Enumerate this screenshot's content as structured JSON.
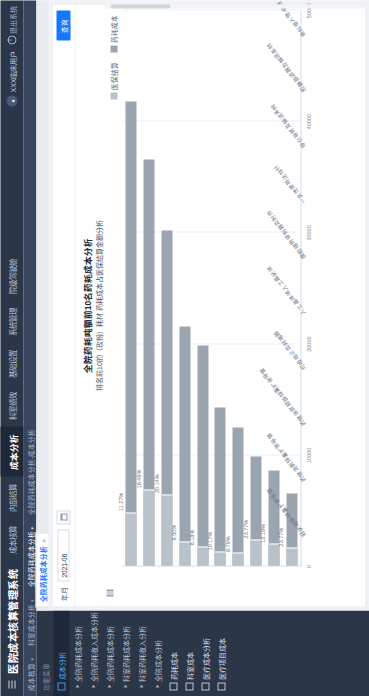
{
  "app": {
    "title": "医院成本核算管理系统",
    "menu_icon": "hamburger-icon"
  },
  "topnav": {
    "items": [
      {
        "label": "成本核算"
      },
      {
        "label": "内部结算"
      },
      {
        "label": "成本分析",
        "active": true
      },
      {
        "label": "科室绩效"
      },
      {
        "label": "基础设置"
      },
      {
        "label": "系统管理"
      },
      {
        "label": "院级驾驶舱"
      }
    ],
    "user": "XXX临床用户",
    "logout": "退出系统"
  },
  "breadcrumb": {
    "items": [
      {
        "label": "成本核算"
      },
      {
        "label": "科室成本分析"
      },
      {
        "label": "全院药耗成本分析"
      },
      {
        "label": "全院药耗成本分析-成本分析"
      }
    ]
  },
  "sidebar": {
    "header": "功能菜单",
    "items": [
      {
        "label": "成本分析",
        "icon": "folder-icon",
        "type": "group",
        "selected": true
      },
      {
        "label": "全院药耗成本分析",
        "icon": "caret-icon",
        "type": "sub"
      },
      {
        "label": "全院药耗收入成本分析",
        "icon": "caret-icon",
        "type": "sub"
      },
      {
        "label": "全院药耗成本分析",
        "icon": "caret-icon",
        "type": "sub"
      },
      {
        "label": "科室药耗成本分析",
        "icon": "caret-icon",
        "type": "sub"
      },
      {
        "label": "科室药耗收入分析",
        "icon": "caret-icon",
        "type": "sub"
      },
      {
        "label": "全院成本分析",
        "icon": "caret-icon",
        "type": "sub"
      },
      {
        "label": "药耗成本",
        "icon": "folder-icon",
        "type": "group"
      },
      {
        "label": "科室成本",
        "icon": "folder-icon",
        "type": "group"
      },
      {
        "label": "医疗成本分析",
        "icon": "folder-icon",
        "type": "group"
      },
      {
        "label": "医疗项目成本",
        "icon": "folder-icon",
        "type": "group"
      }
    ]
  },
  "tabs": [
    {
      "label": "全院药耗成本分析",
      "active": true,
      "close": "×"
    }
  ],
  "filter": {
    "period_label": "年月",
    "period_value": "2021-06",
    "calendar_icon": "calendar-icon",
    "query_button": "查询"
  },
  "chart_data": {
    "type": "bar",
    "title": "全院药耗吨额前10名药耗成本分析",
    "subtitle": "排名前10的（玫粉）耗材 药耗成本占医保结算金额分析",
    "orientation": "horizontal",
    "xlabel": "",
    "ylabel": "",
    "ylim": [
      0,
      50000
    ],
    "yticks": [
      0,
      10000,
      20000,
      30000,
      20000
    ],
    "axis_ticks": [
      "50000",
      "40000",
      "30000",
      "20000",
      "10000",
      "0"
    ],
    "grid": true,
    "legend_position": "top-right",
    "legend": [
      {
        "name": "医保结算",
        "color": "#b9c2c9"
      },
      {
        "name": "药耗成本",
        "color": "#9aa5b0"
      }
    ],
    "categories": [
      "冠状动脉球囊扩张导管",
      "药物洗脱球囊扩张导管",
      "药物涂层冠脉球囊扩张导管",
      "可吸收止血封堵器",
      "人工晶体体人工晶状体",
      "腹腔镜用穿刺器及附件",
      "一次性使用活检针",
      "导引导丝及输送系统",
      "腔静脉滤器及输送系统",
      "骨科植入物-脊柱"
    ],
    "series": [
      {
        "name": "医保结算",
        "values": [
          41800,
          36600,
          30200,
          21500,
          19800,
          14200,
          12400,
          9800,
          8600,
          6500
        ]
      },
      {
        "name": "药耗成本",
        "values": [
          4720,
          6770,
          6350,
          2080,
          1640,
          1180,
          1040,
          2260,
          1870,
          1540
        ]
      }
    ],
    "pct_labels": [
      "11.27%",
      "18.49%",
      "20.14%",
      "9.50%",
      "8.18%",
      "10.17%",
      "8.79%",
      "23.77%",
      "13.19%",
      "23.77%"
    ]
  }
}
